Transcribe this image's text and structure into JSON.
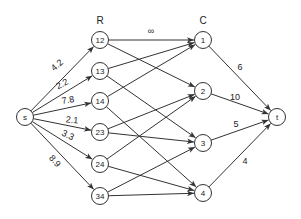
{
  "diagram": {
    "type": "flow-network",
    "columns": {
      "R": {
        "label": "R",
        "x": 100,
        "y": 20
      },
      "C": {
        "label": "C",
        "x": 203,
        "y": 20
      }
    },
    "nodes": [
      {
        "id": "s",
        "label": "s",
        "x": 25,
        "y": 117
      },
      {
        "id": "r12",
        "label": "12",
        "x": 100,
        "y": 40
      },
      {
        "id": "r13",
        "label": "13",
        "x": 100,
        "y": 71
      },
      {
        "id": "r14",
        "label": "14",
        "x": 100,
        "y": 101
      },
      {
        "id": "r23",
        "label": "23",
        "x": 100,
        "y": 132
      },
      {
        "id": "r24",
        "label": "24",
        "x": 100,
        "y": 164
      },
      {
        "id": "r34",
        "label": "34",
        "x": 100,
        "y": 196
      },
      {
        "id": "c1",
        "label": "1",
        "x": 203,
        "y": 40
      },
      {
        "id": "c2",
        "label": "2",
        "x": 203,
        "y": 91
      },
      {
        "id": "c3",
        "label": "3",
        "x": 203,
        "y": 143
      },
      {
        "id": "c4",
        "label": "4",
        "x": 203,
        "y": 193
      },
      {
        "id": "t",
        "label": "t",
        "x": 277,
        "y": 117
      }
    ],
    "edges": [
      {
        "from": "s",
        "to": "r12",
        "label": "4.2",
        "lx": 57,
        "ly": 65,
        "rot": -42
      },
      {
        "from": "s",
        "to": "r13",
        "label": "2.2",
        "lx": 62,
        "ly": 84,
        "rot": -28
      },
      {
        "from": "s",
        "to": "r14",
        "label": "7.8",
        "lx": 68,
        "ly": 100,
        "rot": -10
      },
      {
        "from": "s",
        "to": "r23",
        "label": "2.1",
        "lx": 72,
        "ly": 120,
        "rot": 6
      },
      {
        "from": "s",
        "to": "r24",
        "label": "3.3",
        "lx": 68,
        "ly": 135,
        "rot": 25
      },
      {
        "from": "s",
        "to": "r34",
        "label": "8.9",
        "lx": 55,
        "ly": 161,
        "rot": 48
      },
      {
        "from": "r12",
        "to": "c1",
        "label": "∞",
        "lx": 151,
        "ly": 31,
        "rot": 0
      },
      {
        "from": "r12",
        "to": "c2",
        "label": ""
      },
      {
        "from": "r13",
        "to": "c1",
        "label": ""
      },
      {
        "from": "r13",
        "to": "c3",
        "label": ""
      },
      {
        "from": "r14",
        "to": "c1",
        "label": ""
      },
      {
        "from": "r14",
        "to": "c4",
        "label": ""
      },
      {
        "from": "r23",
        "to": "c2",
        "label": ""
      },
      {
        "from": "r23",
        "to": "c3",
        "label": ""
      },
      {
        "from": "r24",
        "to": "c2",
        "label": ""
      },
      {
        "from": "r24",
        "to": "c4",
        "label": ""
      },
      {
        "from": "r34",
        "to": "c3",
        "label": ""
      },
      {
        "from": "r34",
        "to": "c4",
        "label": ""
      },
      {
        "from": "c1",
        "to": "t",
        "label": "6",
        "lx": 240,
        "ly": 67,
        "rot": 0
      },
      {
        "from": "c2",
        "to": "t",
        "label": "10",
        "lx": 235,
        "ly": 97,
        "rot": 0
      },
      {
        "from": "c3",
        "to": "t",
        "label": "5",
        "lx": 236,
        "ly": 124,
        "rot": 0
      },
      {
        "from": "c4",
        "to": "t",
        "label": "4",
        "lx": 245,
        "ly": 161,
        "rot": 0
      }
    ],
    "node_radius": 8.5,
    "stroke_color": "#333333",
    "background": "#ffffff"
  }
}
